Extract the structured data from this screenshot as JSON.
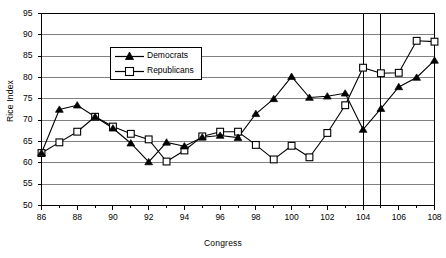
{
  "chart_data": {
    "type": "line",
    "title": "",
    "xlabel": "Congress",
    "ylabel": "Rice Index",
    "xlim": [
      86,
      108
    ],
    "ylim": [
      50,
      95
    ],
    "grid": true,
    "legend_position": "upper-left-inside",
    "x_tick_step": 2,
    "y_tick_step": 5,
    "x_minor_tick_step": 1,
    "x_ticks": [
      86,
      88,
      90,
      92,
      94,
      96,
      98,
      100,
      102,
      104,
      106,
      108
    ],
    "y_ticks": [
      50,
      55,
      60,
      65,
      70,
      75,
      80,
      85,
      90,
      95
    ],
    "x": [
      86,
      87,
      88,
      89,
      90,
      91,
      92,
      93,
      94,
      95,
      96,
      97,
      98,
      99,
      100,
      101,
      102,
      103,
      104,
      105,
      106,
      107,
      108
    ],
    "series": [
      {
        "name": "Democrats",
        "marker": "filled-triangle",
        "values": [
          62.3,
          72.5,
          73.5,
          70.8,
          68.1,
          64.6,
          60.2,
          64.8,
          63.9,
          66.0,
          66.4,
          65.9,
          71.5,
          75.0,
          80.2,
          75.3,
          75.6,
          76.3,
          67.8,
          72.7,
          77.8,
          80.0,
          84.0
        ]
      },
      {
        "name": "Republicans",
        "marker": "open-square",
        "values": [
          62.3,
          64.8,
          67.3,
          70.8,
          68.5,
          66.8,
          65.5,
          60.3,
          62.9,
          66.2,
          67.3,
          67.3,
          64.2,
          60.8,
          64.0,
          61.3,
          67.0,
          73.5,
          82.3,
          81.0,
          81.1,
          88.6,
          88.4
        ]
      }
    ],
    "reference_lines": [
      {
        "name": "congress-104-line",
        "x": 104
      },
      {
        "name": "congress-105-line",
        "x": 105
      }
    ]
  },
  "legend": {
    "entries": [
      {
        "label": "Democrats",
        "marker": "filled-triangle"
      },
      {
        "label": "Republicans",
        "marker": "open-square"
      }
    ]
  }
}
